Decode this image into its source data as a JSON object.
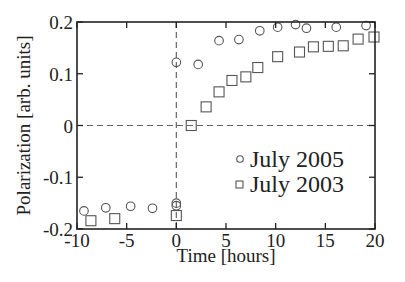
{
  "chart_data": {
    "type": "scatter",
    "title": "",
    "xlabel": "Time [hours]",
    "ylabel": "Polarization [arb. units]",
    "xlim": [
      -10,
      20
    ],
    "ylim": [
      -0.2,
      0.2
    ],
    "xticks": [
      -10,
      -5,
      0,
      5,
      10,
      15,
      20
    ],
    "xtick_labels": [
      "-10",
      "-5",
      "0",
      "5",
      "10",
      "15",
      "20"
    ],
    "yticks": [
      -0.2,
      -0.1,
      0,
      0.1,
      0.2
    ],
    "ytick_labels": [
      "-0.2",
      "-0.1",
      "0",
      "0.1",
      "0.2"
    ],
    "grid": false,
    "reference_lines": [
      {
        "orientation": "horizontal",
        "value": 0,
        "style": "dashed"
      },
      {
        "orientation": "vertical",
        "value": 0,
        "style": "dashed"
      }
    ],
    "legend_position": "lower right",
    "series": [
      {
        "name": "July 2005",
        "marker": "circle",
        "x": [
          -9.3,
          -7.1,
          -4.6,
          -2.4,
          0.0,
          0.0,
          0.0,
          2.2,
          4.3,
          6.3,
          8.4,
          10.2,
          12.0,
          13.1,
          16.1,
          19.1
        ],
        "y": [
          -0.165,
          -0.159,
          -0.156,
          -0.16,
          -0.155,
          -0.15,
          0.122,
          0.118,
          0.164,
          0.166,
          0.183,
          0.19,
          0.195,
          0.188,
          0.19,
          0.193
        ]
      },
      {
        "name": "July 2003",
        "marker": "square",
        "x": [
          -8.6,
          -6.2,
          0.0,
          1.5,
          3.0,
          4.3,
          5.6,
          7.0,
          8.2,
          10.2,
          12.4,
          13.8,
          15.3,
          16.8,
          18.3,
          19.9
        ],
        "y": [
          -0.184,
          -0.18,
          -0.174,
          0.0,
          0.036,
          0.065,
          0.087,
          0.094,
          0.112,
          0.133,
          0.142,
          0.152,
          0.153,
          0.154,
          0.167,
          0.171
        ]
      }
    ]
  },
  "legend": {
    "items": [
      {
        "label": "July 2005",
        "marker": "circle"
      },
      {
        "label": "July 2003",
        "marker": "square"
      }
    ]
  },
  "colors": {
    "axis": "#222222",
    "marker": "#555555",
    "dashed": "#666666"
  }
}
